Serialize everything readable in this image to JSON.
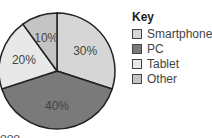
{
  "chart_data": {
    "type": "pie",
    "title": "",
    "categories": [
      "Smartphone",
      "PC",
      "Tablet",
      "Other"
    ],
    "values": [
      30,
      40,
      20,
      10
    ],
    "labels": [
      "30%",
      "40%",
      "20%",
      "10%"
    ],
    "colors": [
      "#d6d6d6",
      "#7a7a7a",
      "#e8e8e8",
      "#c4c4c4"
    ],
    "legend_title": "Key",
    "legend_position": "right"
  },
  "legend": {
    "title": "Key",
    "items": [
      {
        "label": "Smartphone",
        "color": "#d6d6d6"
      },
      {
        "label": "PC",
        "color": "#7a7a7a"
      },
      {
        "label": "Tablet",
        "color": "#e8e8e8"
      },
      {
        "label": "Other",
        "color": "#c4c4c4"
      }
    ]
  },
  "footer_fragment": "ooo"
}
